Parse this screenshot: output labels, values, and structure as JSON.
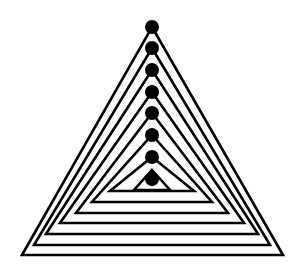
{
  "figure": {
    "stroke_color": "#000000",
    "background": "#ffffff",
    "triangle_count": 8,
    "triangles": [
      {
        "apex": [
          152,
          27
        ],
        "base_y": 255,
        "left_x": 22,
        "right_x": 283
      },
      {
        "apex": [
          152,
          48
        ],
        "base_y": 245,
        "left_x": 34,
        "right_x": 270
      },
      {
        "apex": [
          152,
          70
        ],
        "base_y": 234,
        "left_x": 46,
        "right_x": 258
      },
      {
        "apex": [
          152,
          92
        ],
        "base_y": 223,
        "left_x": 60,
        "right_x": 244
      },
      {
        "apex": [
          152,
          113
        ],
        "base_y": 213,
        "left_x": 76,
        "right_x": 228
      },
      {
        "apex": [
          152,
          135
        ],
        "base_y": 202,
        "left_x": 92,
        "right_x": 212
      },
      {
        "apex": [
          152,
          157
        ],
        "base_y": 191,
        "left_x": 110,
        "right_x": 194
      },
      {
        "apex": [
          152,
          170
        ],
        "base_y": 190,
        "left_x": 134,
        "right_x": 170
      }
    ],
    "dots": [
      {
        "cx": 152,
        "cy": 27,
        "r": 7
      },
      {
        "cx": 152,
        "cy": 48,
        "r": 7
      },
      {
        "cx": 152,
        "cy": 70,
        "r": 7
      },
      {
        "cx": 152,
        "cy": 92,
        "r": 7
      },
      {
        "cx": 152,
        "cy": 113,
        "r": 7
      },
      {
        "cx": 152,
        "cy": 135,
        "r": 7
      },
      {
        "cx": 152,
        "cy": 157,
        "r": 7
      },
      {
        "cx": 152,
        "cy": 179,
        "r": 7
      }
    ]
  }
}
